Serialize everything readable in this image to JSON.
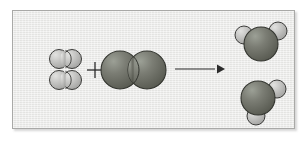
{
  "figure": {
    "kind": "chemical-reaction-diagram",
    "model_style": "space-filling",
    "panel_background": "#e9e9e7",
    "panel_border_color": "#a9a9a7",
    "operator_plus": "+",
    "arrow_direction": "right"
  },
  "legend": {
    "hydrogen_color": "#b9b9b7",
    "hydrogen_highlight": "#dcdcda",
    "oxygen_color": "#6d6f68",
    "oxygen_highlight": "#9a9c92",
    "outline_color": "#3a3a38",
    "arrow_color": "#2b2b2b",
    "plus_color": "#2b2b2b"
  },
  "chart_data": {
    "type": "diagram",
    "equation": "2 H2 + O2 -> 2 H2O",
    "reactants": [
      {
        "name": "hydrogen-molecule-1",
        "formula": "H2",
        "atoms": [
          {
            "element": "H",
            "cx": 46,
            "cy": 48,
            "r": 9.5,
            "color": "#b9b9b7"
          },
          {
            "element": "H",
            "cx": 59,
            "cy": 48,
            "r": 9.5,
            "color": "#b9b9b7"
          }
        ]
      },
      {
        "name": "hydrogen-molecule-2",
        "formula": "H2",
        "atoms": [
          {
            "element": "H",
            "cx": 46,
            "cy": 69,
            "r": 9.5,
            "color": "#b9b9b7"
          },
          {
            "element": "H",
            "cx": 59,
            "cy": 69,
            "r": 9.5,
            "color": "#b9b9b7"
          }
        ]
      },
      {
        "name": "oxygen-molecule",
        "formula": "O2",
        "atoms": [
          {
            "element": "O",
            "cx": 107,
            "cy": 59,
            "r": 19,
            "color": "#6d6f68"
          },
          {
            "element": "O",
            "cx": 134,
            "cy": 59,
            "r": 19,
            "color": "#6d6f68"
          }
        ]
      }
    ],
    "products": [
      {
        "name": "water-molecule-1",
        "formula": "H2O",
        "atoms": [
          {
            "element": "H",
            "cx": 231,
            "cy": 24,
            "r": 9,
            "color": "#b9b9b7"
          },
          {
            "element": "H",
            "cx": 265,
            "cy": 20,
            "r": 9,
            "color": "#b9b9b7"
          },
          {
            "element": "O",
            "cx": 248,
            "cy": 33,
            "r": 17,
            "color": "#6d6f68"
          }
        ]
      },
      {
        "name": "water-molecule-2",
        "formula": "H2O",
        "atoms": [
          {
            "element": "H",
            "cx": 264,
            "cy": 78,
            "r": 9,
            "color": "#b9b9b7"
          },
          {
            "element": "H",
            "cx": 243,
            "cy": 105,
            "r": 9,
            "color": "#b9b9b7"
          },
          {
            "element": "O",
            "cx": 245,
            "cy": 87,
            "r": 17,
            "color": "#6d6f68"
          }
        ]
      }
    ],
    "annotations": [
      {
        "name": "plus-operator",
        "text": "+",
        "x": 82,
        "y": 59
      },
      {
        "name": "reaction-arrow",
        "x1": 162,
        "y1": 58,
        "x2": 206,
        "y2": 58
      }
    ],
    "grid": false,
    "legend_position": "none"
  }
}
